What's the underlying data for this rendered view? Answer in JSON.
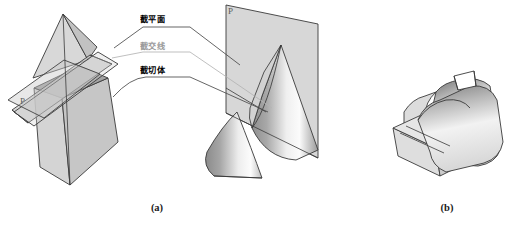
{
  "figure": {
    "background_color": "#ffffff",
    "width": 517,
    "height": 229
  },
  "labels": {
    "cutting_plane": {
      "text": "截平面",
      "color": "#000000",
      "x": 148,
      "y": 21
    },
    "intersection_line": {
      "text": "截交线",
      "color": "#9a9a9a",
      "x": 148,
      "y": 47
    },
    "cut_solid": {
      "text": "截切体",
      "color": "#000000",
      "x": 148,
      "y": 71
    }
  },
  "plane_letters": {
    "left": {
      "text": "P",
      "x": 20,
      "y": 104
    },
    "right": {
      "text": "P",
      "x": 228,
      "y": 14
    }
  },
  "captions": {
    "left": {
      "text": "(a)",
      "x": 157,
      "y": 211
    },
    "right": {
      "text": "(b)",
      "x": 447,
      "y": 211
    }
  },
  "colors": {
    "outline": "#3a3a3a",
    "plane_fill": "#c9c9c9",
    "solid_fill_light": "#e3e3e3",
    "solid_fill_mid": "#c4c4c4",
    "solid_fill_dark": "#9d9d9d",
    "cut_face": "#a8a8a8",
    "leader_dark": "#4a4a4a",
    "leader_light": "#b4b4b4",
    "caption": "#1a1a1a",
    "letter": "#5c5c5c"
  },
  "shapes": {
    "left_group": "pyramid-cut-by-plane",
    "right_group": "cone-cut-by-plane",
    "figure_b": "half-cylinder-with-notch"
  }
}
